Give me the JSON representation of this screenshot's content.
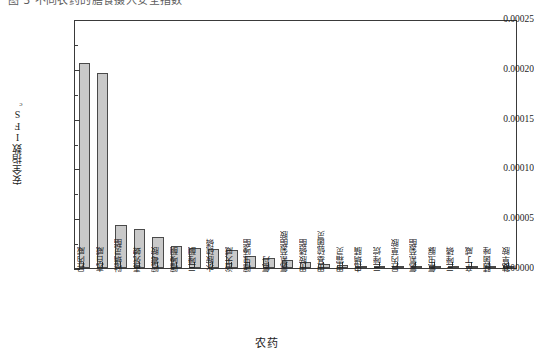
{
  "caption": {
    "text": "图 3 不同农药的膳食摄入安全指数"
  },
  "chart_data": {
    "type": "bar",
    "title": "",
    "xlabel": "农药",
    "ylabel": "安全指数IFS",
    "ylabel_sub": "c",
    "ylim": [
      0.0,
      0.00025
    ],
    "ytick_labels": [
      "0.00000",
      "0.00005",
      "0.00010",
      "0.00015",
      "0.00020",
      "0.00025"
    ],
    "ytick_values": [
      0.0,
      5e-05,
      0.0001,
      0.00015,
      0.0002,
      0.00025
    ],
    "minor_ticks_per_interval": 1,
    "grid": false,
    "legend": null,
    "bar_color": "#c9c9c9",
    "bar_edge_color": "#4a4a4a",
    "axis_color": "#3a3a3a",
    "categories": [
      "异丙威",
      "克百威",
      "哒螨灵酯",
      "毒死蜱",
      "嘧霉胺",
      "噻嗪酮",
      "三唑酮",
      "水胺硫磷",
      "浴天威",
      "噻虫嗪酯",
      "氟丹",
      "氯氰菊酯胺",
      "甲胺磷酯",
      "甲基硫菌灵",
      "甲霜灵",
      "虫螨腈",
      "三唑烷",
      "异丙草胺",
      "氯氰菊酯",
      "氟虫脲",
      "三唑磷",
      "辛丁威",
      "腈菌唑",
      "敌草胺"
    ],
    "values": [
      0.000206,
      0.000196,
      4.35e-05,
      3.95e-05,
      3.15e-05,
      2.25e-05,
      2.05e-05,
      1.95e-05,
      1.85e-05,
      1.25e-05,
      1.05e-05,
      8.5e-06,
      6.5e-06,
      4.5e-06,
      3.5e-06,
      2.5e-06,
      1.2e-06,
      8e-07,
      6e-07,
      5e-07,
      4e-07,
      3e-07,
      2e-07,
      1e-07
    ]
  },
  "plot_geometry": {
    "left": 74,
    "top": 20,
    "width": 443,
    "height": 249
  }
}
